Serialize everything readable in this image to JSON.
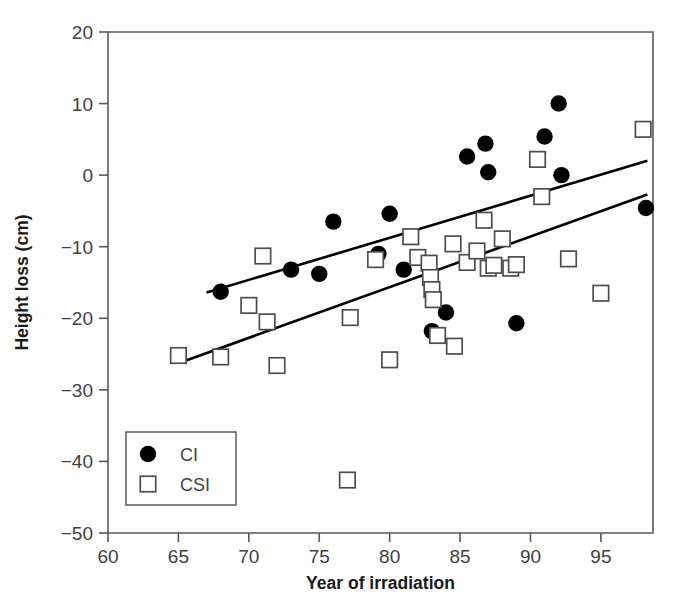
{
  "chart_data": {
    "type": "scatter",
    "title": "",
    "xlabel": "Year of irradiation",
    "ylabel": "Height loss (cm)",
    "xlim": [
      60,
      98.7
    ],
    "ylim": [
      -50,
      20
    ],
    "xticks": [
      60,
      65,
      70,
      75,
      80,
      85,
      90,
      95
    ],
    "yticks": [
      20,
      10,
      0,
      -10,
      -20,
      -30,
      -40,
      -50
    ],
    "xtick_labels": [
      "60",
      "65",
      "70",
      "75",
      "80",
      "85",
      "90",
      "95"
    ],
    "ytick_labels": [
      "20",
      "10",
      "0",
      "−10",
      "−20",
      "−30",
      "−40",
      "−50"
    ],
    "grid": false,
    "legend_position": "lower left",
    "series": [
      {
        "name": "CI",
        "marker": "filled-circle",
        "color": "#000000",
        "points": [
          [
            68.0,
            -16.3
          ],
          [
            73.0,
            -13.2
          ],
          [
            75.0,
            -13.8
          ],
          [
            76.0,
            -6.5
          ],
          [
            79.2,
            -11.0
          ],
          [
            80.0,
            -5.4
          ],
          [
            81.0,
            -13.2
          ],
          [
            83.0,
            -21.8
          ],
          [
            84.0,
            -19.2
          ],
          [
            85.5,
            2.6
          ],
          [
            86.8,
            4.4
          ],
          [
            87.0,
            0.4
          ],
          [
            89.0,
            -20.7
          ],
          [
            91.0,
            5.4
          ],
          [
            92.0,
            10.0
          ],
          [
            92.2,
            0.0
          ],
          [
            98.2,
            -4.6
          ]
        ]
      },
      {
        "name": "CSI",
        "marker": "open-square",
        "color": "#4d4d4f",
        "points": [
          [
            65.0,
            -25.2
          ],
          [
            68.0,
            -25.4
          ],
          [
            70.0,
            -18.2
          ],
          [
            71.0,
            -11.3
          ],
          [
            71.3,
            -20.5
          ],
          [
            72.0,
            -26.6
          ],
          [
            77.0,
            -42.6
          ],
          [
            77.2,
            -19.9
          ],
          [
            79.0,
            -11.8
          ],
          [
            80.0,
            -25.8
          ],
          [
            81.5,
            -8.6
          ],
          [
            82.0,
            -11.5
          ],
          [
            82.8,
            -12.3
          ],
          [
            82.9,
            -14.3
          ],
          [
            83.0,
            -16.0
          ],
          [
            83.1,
            -17.4
          ],
          [
            83.4,
            -22.4
          ],
          [
            84.5,
            -9.6
          ],
          [
            84.6,
            -23.9
          ],
          [
            85.5,
            -12.2
          ],
          [
            86.2,
            -10.6
          ],
          [
            86.7,
            -6.3
          ],
          [
            87.0,
            -13.0
          ],
          [
            87.4,
            -12.6
          ],
          [
            88.0,
            -8.9
          ],
          [
            88.6,
            -13.0
          ],
          [
            89.0,
            -12.5
          ],
          [
            90.5,
            2.2
          ],
          [
            90.8,
            -3.0
          ],
          [
            92.7,
            -11.7
          ],
          [
            95.0,
            -16.5
          ],
          [
            98.0,
            6.4
          ]
        ]
      }
    ],
    "fit_lines": [
      {
        "name": "CI regression line",
        "x_start": 67.0,
        "y_start": -16.4,
        "x_end": 98.3,
        "y_end": 2.0
      },
      {
        "name": "CSI regression line",
        "x_start": 65.1,
        "y_start": -26.2,
        "x_end": 98.3,
        "y_end": -2.7
      }
    ]
  },
  "legend": {
    "entries": [
      {
        "label": "CI",
        "marker": "filled-circle"
      },
      {
        "label": "CSI",
        "marker": "open-square"
      }
    ]
  }
}
